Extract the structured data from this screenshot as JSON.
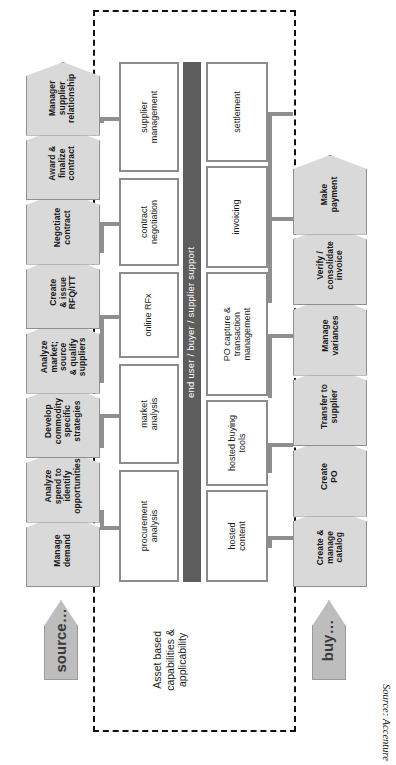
{
  "diagram": {
    "source_note": "Source: Accenture",
    "support_bar_label": "end user / buyer / supplier support",
    "asset_label": "Asset based\ncapabilities &\napplicability",
    "source_arrow_label": "source…",
    "buy_arrow_label": "buy…",
    "colors": {
      "chevron_fill": "#d9d9d9",
      "chevron_border": "#909090",
      "box_border": "#8c8c8c",
      "support_bar": "#5d5d5d",
      "arrow_fill": "#bdbdbd",
      "dashed_border": "#111111"
    }
  },
  "source_process": {
    "name": "source",
    "steps": [
      {
        "id": "manage-demand",
        "label": "Manage\ndemand"
      },
      {
        "id": "analyze-spend",
        "label": "Analyze\nspend to\nidentify\nopportunities"
      },
      {
        "id": "develop-commodity",
        "label": "Develop\ncommodity\nspecific\nstrategies"
      },
      {
        "id": "analyze-market",
        "label": "Analyze\nmarket;\nsource\n& qualify\nsuppliers"
      },
      {
        "id": "create-issue-rfq",
        "label": "Create\n& issue\nRFQ/ITT"
      },
      {
        "id": "negotiate-contract",
        "label": "Negotiate\ncontract"
      },
      {
        "id": "award-finalize",
        "label": "Award &\nfinalize\ncontract"
      },
      {
        "id": "manage-supplier-rel",
        "label": "Manager\nsupplier\nrelationship"
      }
    ]
  },
  "source_capabilities": [
    {
      "id": "procurement-analysis",
      "label": "procurement\nanalysis"
    },
    {
      "id": "market-analysis",
      "label": "market\nanalysis"
    },
    {
      "id": "online-rfx",
      "label": "online RFx"
    },
    {
      "id": "contract-negotiation",
      "label": "contract\nnegotiation"
    },
    {
      "id": "supplier-management",
      "label": "supplier\nmanagement"
    }
  ],
  "buy_capabilities": [
    {
      "id": "hosted-content",
      "label": "hosted\ncontent"
    },
    {
      "id": "hosted-buying-tools",
      "label": "hosted buying\ntools"
    },
    {
      "id": "po-capture",
      "label": "PO capture &\ntransaction\nmanagement"
    },
    {
      "id": "invoicing",
      "label": "invoicing"
    },
    {
      "id": "settlement",
      "label": "settlement"
    }
  ],
  "buy_process": {
    "name": "buy",
    "steps": [
      {
        "id": "create-manage-catalog",
        "label": "Create &\nmanage\ncatalog"
      },
      {
        "id": "create-po",
        "label": "Create\nPO"
      },
      {
        "id": "transfer-to-supplier",
        "label": "Transfer to\nsupplier"
      },
      {
        "id": "manage-variances",
        "label": "Manage\nvariances"
      },
      {
        "id": "verify-consolidate",
        "label": "Verify /\nconsolidate\ninvoice"
      },
      {
        "id": "make-payment",
        "label": "Make\npayment"
      }
    ]
  }
}
